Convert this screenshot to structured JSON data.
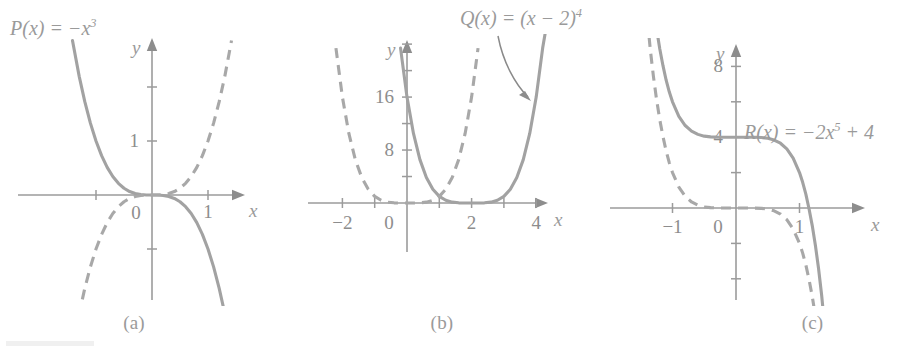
{
  "figure": {
    "background": "#ffffff",
    "curve_color": "#a2a2a2",
    "axis_color": "#9b9b9b",
    "text_color": "#8e8e8e"
  },
  "labels": {
    "p_prefix": "P(x) = −x",
    "p_exp": "3",
    "q_prefix": "Q(x) = (x − 2)",
    "q_exp": "4",
    "r_prefix": "R(x) = −2x",
    "r_exp": "5",
    "r_suffix": " + 4"
  },
  "captions": {
    "a": "(a)",
    "b": "(b)",
    "c": "(c)"
  },
  "axis_names": {
    "x": "x",
    "y": "y"
  },
  "chart_data": [
    {
      "panel": "a",
      "type": "line",
      "title": "P(x) = −x³",
      "xlabel": "x",
      "ylabel": "y",
      "xlim": [
        -1.75,
        1.75
      ],
      "ylim": [
        -2.3,
        2.6
      ],
      "grid": false,
      "origin_label": "0",
      "xticks": [
        -1,
        1
      ],
      "xtick_labels": [
        "",
        "1"
      ],
      "yticks": [
        -1,
        1,
        2
      ],
      "ytick_labels": [
        "",
        "1",
        ""
      ],
      "series": [
        {
          "name": "P(x) = -x^3",
          "style": "solid",
          "expr": "-x^3",
          "x": [
            -1.42,
            -1.3,
            -1.2,
            -1.1,
            -1.0,
            -0.9,
            -0.8,
            -0.7,
            -0.6,
            -0.5,
            -0.4,
            -0.3,
            -0.2,
            -0.1,
            0.0,
            0.1,
            0.2,
            0.3,
            0.4,
            0.5,
            0.6,
            0.7,
            0.8,
            0.9,
            1.0,
            1.1,
            1.2,
            1.3,
            1.42
          ],
          "y": [
            2.86,
            2.197,
            1.728,
            1.331,
            1.0,
            0.729,
            0.512,
            0.343,
            0.216,
            0.125,
            0.064,
            0.027,
            0.008,
            0.001,
            0.0,
            -0.001,
            -0.008,
            -0.027,
            -0.064,
            -0.125,
            -0.216,
            -0.343,
            -0.512,
            -0.729,
            -1.0,
            -1.331,
            -1.728,
            -2.197,
            -2.86
          ]
        },
        {
          "name": "y = x^3",
          "style": "dashed",
          "expr": "x^3",
          "x": [
            -1.42,
            -1.3,
            -1.2,
            -1.1,
            -1.0,
            -0.9,
            -0.8,
            -0.7,
            -0.6,
            -0.5,
            -0.4,
            -0.3,
            -0.2,
            -0.1,
            0.0,
            0.1,
            0.2,
            0.3,
            0.4,
            0.5,
            0.6,
            0.7,
            0.8,
            0.9,
            1.0,
            1.1,
            1.2,
            1.3,
            1.42
          ],
          "y": [
            -2.86,
            -2.197,
            -1.728,
            -1.331,
            -1.0,
            -0.729,
            -0.512,
            -0.343,
            -0.216,
            -0.125,
            -0.064,
            -0.027,
            -0.008,
            -0.001,
            0.0,
            0.001,
            0.008,
            0.027,
            0.064,
            0.125,
            0.216,
            0.343,
            0.512,
            0.729,
            1.0,
            1.331,
            1.728,
            2.197,
            2.86
          ]
        }
      ]
    },
    {
      "panel": "b",
      "type": "line",
      "title": "Q(x) = (x − 2)⁴",
      "xlabel": "x",
      "ylabel": "y",
      "xlim": [
        -2.9,
        5.2
      ],
      "ylim": [
        -5,
        27
      ],
      "grid": false,
      "origin_label": "0",
      "xticks": [
        -2,
        -1,
        1,
        2,
        3,
        4
      ],
      "xtick_labels": [
        "−2",
        "",
        "",
        "2",
        "",
        "4"
      ],
      "yticks": [
        4,
        8,
        12,
        16,
        20,
        24
      ],
      "ytick_labels": [
        "",
        "8",
        "",
        "16",
        "",
        ""
      ],
      "series": [
        {
          "name": "Q(x) = (x-2)^4",
          "style": "solid",
          "expr": "(x-2)^4",
          "x": [
            -0.2,
            0.0,
            0.2,
            0.4,
            0.6,
            0.8,
            1.0,
            1.2,
            1.4,
            1.6,
            1.8,
            2.0,
            2.2,
            2.4,
            2.6,
            2.8,
            3.0,
            3.2,
            3.4,
            3.6,
            3.8,
            4.0,
            4.2,
            4.36
          ],
          "y": [
            23.4,
            16.0,
            10.5,
            6.55,
            3.84,
            2.07,
            1.0,
            0.41,
            0.13,
            0.026,
            0.0016,
            0.0,
            0.0016,
            0.026,
            0.13,
            0.41,
            1.0,
            2.07,
            3.84,
            6.55,
            10.5,
            16.0,
            23.4,
            28.0
          ]
        },
        {
          "name": "y = x^4",
          "style": "dashed",
          "expr": "x^4",
          "x": [
            -2.2,
            -2.0,
            -1.8,
            -1.6,
            -1.4,
            -1.2,
            -1.0,
            -0.8,
            -0.6,
            -0.4,
            -0.2,
            0.0,
            0.2,
            0.4,
            0.6,
            0.8,
            1.0,
            1.2,
            1.4,
            1.6,
            1.8,
            2.0,
            2.2
          ],
          "y": [
            23.4,
            16.0,
            10.5,
            6.55,
            3.84,
            2.07,
            1.0,
            0.41,
            0.13,
            0.026,
            0.0016,
            0.0,
            0.0016,
            0.026,
            0.13,
            0.41,
            1.0,
            2.07,
            3.84,
            6.55,
            10.5,
            16.0,
            23.4
          ]
        }
      ],
      "annotation": {
        "text": "Q(x) = (x − 2)⁴",
        "arrow": "curved-pointer-to-solid-curve"
      }
    },
    {
      "panel": "c",
      "type": "line",
      "title": "R(x) = −2x⁵ + 4",
      "xlabel": "x",
      "ylabel": "y",
      "xlim": [
        -1.75,
        1.55
      ],
      "ylim": [
        -9.5,
        10.5
      ],
      "grid": false,
      "origin_label": "0",
      "xticks": [
        -1,
        1
      ],
      "xtick_labels": [
        "−1",
        "1"
      ],
      "yticks": [
        -6,
        -4,
        -2,
        2,
        4,
        6,
        8
      ],
      "ytick_labels": [
        "",
        "",
        "",
        "",
        "4",
        "",
        "8"
      ],
      "series": [
        {
          "name": "R(x) = -2x^5 + 4",
          "style": "solid",
          "expr": "-2x^5 + 4",
          "x": [
            -1.42,
            -1.35,
            -1.3,
            -1.25,
            -1.2,
            -1.15,
            -1.1,
            -1.05,
            -1.0,
            -0.9,
            -0.8,
            -0.7,
            -0.6,
            -0.5,
            -0.4,
            -0.3,
            -0.2,
            -0.1,
            0.0,
            0.1,
            0.2,
            0.3,
            0.4,
            0.5,
            0.6,
            0.7,
            0.8,
            0.9,
            1.0,
            1.05,
            1.1,
            1.15,
            1.2,
            1.25,
            1.3,
            1.35,
            1.42
          ],
          "y": [
            15.58,
            12.97,
            11.42,
            10.1,
            8.98,
            8.04,
            7.22,
            6.55,
            6.0,
            5.18,
            4.66,
            4.34,
            4.16,
            4.06,
            4.02,
            4.005,
            4.0006,
            4.00002,
            4.0,
            3.99998,
            3.9994,
            3.995,
            3.98,
            3.94,
            3.84,
            3.66,
            3.34,
            2.82,
            2.0,
            1.45,
            0.78,
            -0.04,
            -0.98,
            -2.1,
            -3.42,
            -4.97,
            -7.58
          ]
        },
        {
          "name": "y = -2x^5",
          "style": "dashed",
          "expr": "-2x^5",
          "x": [
            -1.42,
            -1.35,
            -1.3,
            -1.25,
            -1.2,
            -1.15,
            -1.1,
            -1.05,
            -1.0,
            -0.9,
            -0.8,
            -0.7,
            -0.6,
            -0.5,
            -0.4,
            -0.3,
            -0.2,
            -0.1,
            0.0,
            0.1,
            0.2,
            0.3,
            0.4,
            0.5,
            0.6,
            0.7,
            0.8,
            0.9,
            1.0,
            1.05,
            1.1,
            1.15,
            1.2,
            1.25,
            1.3
          ],
          "y": [
            11.58,
            8.97,
            7.42,
            6.1,
            4.98,
            4.04,
            3.22,
            2.55,
            2.0,
            1.18,
            0.66,
            0.34,
            0.16,
            0.06,
            0.02,
            0.005,
            0.0006,
            2e-05,
            0.0,
            -2e-05,
            -0.0006,
            -0.005,
            -0.02,
            -0.06,
            -0.16,
            -0.34,
            -0.66,
            -1.18,
            -2.0,
            -2.55,
            -3.22,
            -4.04,
            -4.98,
            -6.1,
            -7.42
          ]
        }
      ]
    }
  ]
}
